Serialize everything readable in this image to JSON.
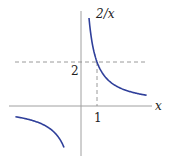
{
  "chart_data": {
    "type": "line",
    "title": "",
    "function": "2/x",
    "series": [
      {
        "name": "2/x",
        "branch": "positive",
        "x": [
          0.5,
          0.75,
          1,
          1.5,
          2,
          3,
          4.1
        ],
        "y": [
          4,
          2.667,
          2,
          1.333,
          1,
          0.667,
          0.488
        ]
      },
      {
        "name": "2/x",
        "branch": "negative",
        "x": [
          -4.1,
          -3,
          -2,
          -1.5,
          -1.06
        ],
        "y": [
          -0.488,
          -0.667,
          -1,
          -1.333,
          -1.887
        ]
      }
    ],
    "xlabel": "x",
    "ylabel": "",
    "curve_label": "2/x",
    "x_tick_labels": [
      "1"
    ],
    "y_tick_labels": [
      "2"
    ],
    "reference_lines": [
      {
        "type": "horizontal",
        "y": 2,
        "style": "dashed"
      },
      {
        "type": "vertical",
        "x": 1,
        "style": "dashed",
        "from_y": 0,
        "to_y": 2
      }
    ],
    "xlim": [
      -4.5,
      4.5
    ],
    "ylim": [
      -2.3,
      4.3
    ],
    "grid": false,
    "legend": "none",
    "colors": {
      "curve": "#2f3f9a",
      "axis": "#9a9a9a",
      "dashed": "#777777"
    }
  },
  "labels": {
    "curve": "2/x",
    "x_axis": "x",
    "x_tick": "1",
    "y_tick": "2"
  }
}
